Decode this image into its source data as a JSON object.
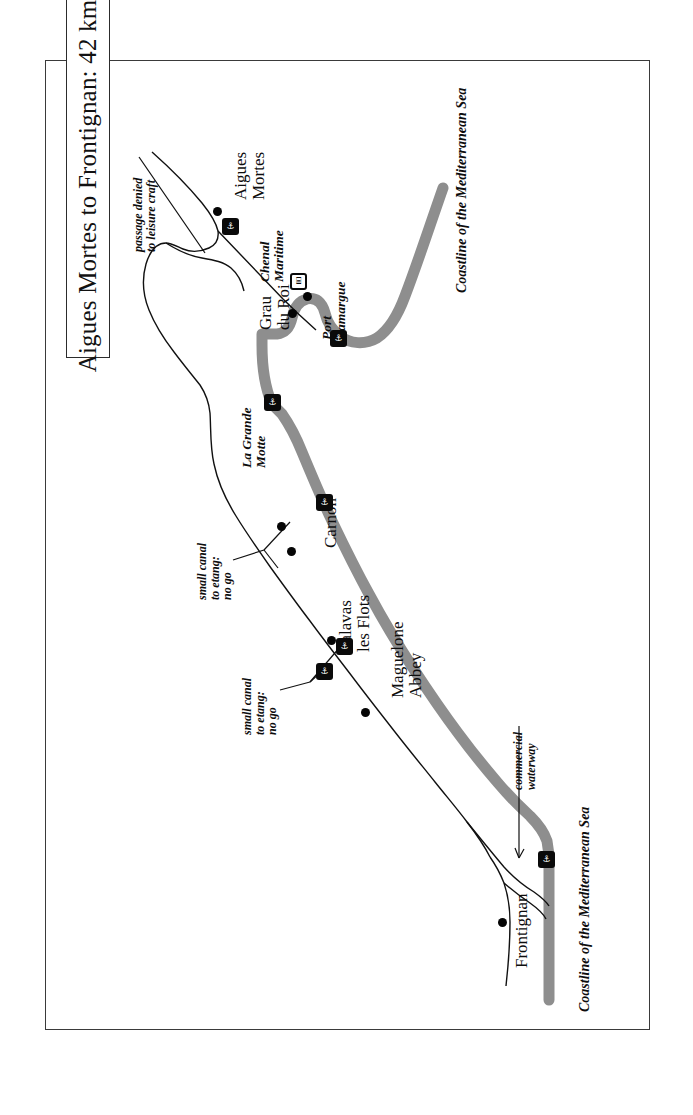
{
  "figure": {
    "title": "Aigues Mortes to Frontignan: 42 km ... no lock",
    "type": "nautical-route-map",
    "orientation": "rotated-90-ccw",
    "frame_color": "#3a3a3a",
    "coast_band_color": "#8c8c8c",
    "ink_color": "#0d0d0d"
  },
  "places": [
    {
      "id": "aigues-mortes",
      "name": "Aigues Mortes",
      "style": "roman"
    },
    {
      "id": "grau-du-roi",
      "name": "Grau\ndu Roi",
      "style": "roman"
    },
    {
      "id": "carnon",
      "name": "Carnon",
      "style": "roman"
    },
    {
      "id": "palavas",
      "name": "Palavas\nles Flots",
      "style": "roman"
    },
    {
      "id": "maguelone",
      "name": "Maguelone\nAbbey",
      "style": "roman"
    },
    {
      "id": "frontignan",
      "name": "Frontignan",
      "style": "roman"
    }
  ],
  "place_labels": {
    "aigues_mortes_l1": "Aigues",
    "aigues_mortes_l2": "Mortes",
    "grau_du_roi_l1": "Grau",
    "grau_du_roi_l2": "du Roi",
    "carnon": "Carnon",
    "palavas_l1": "Palavas",
    "palavas_l2": "les Flots",
    "maguelone_l1": "Maguelone",
    "maguelone_l2": "Abbey",
    "frontignan": "Frontignan"
  },
  "feature_labels": {
    "chenal_maritime_l1": "Chenal",
    "chenal_maritime_l2": "Maritime",
    "port_camargue_l1": "Port",
    "port_camargue_l2": "Camargue",
    "la_grande_motte_l1": "La Grande",
    "la_grande_motte_l2": "Motte",
    "coastline_top": "Coastline of the Mediterranean Sea",
    "coastline_bottom": "Coastline of the Mediterranean Sea"
  },
  "annotations": [
    {
      "id": "passage-denied",
      "line1": "passage denied",
      "line2": "to leisure craft",
      "style": "italic"
    },
    {
      "id": "small-canal-north",
      "line1": "small canal",
      "line2": "to etang:",
      "line3": "no go",
      "style": "italic"
    },
    {
      "id": "small-canal-south",
      "line1": "small canal",
      "line2": "to etang:",
      "line3": "no go",
      "style": "italic"
    },
    {
      "id": "commercial-waterway",
      "line1": "commercial",
      "line2": "waterway",
      "style": "italic"
    }
  ],
  "annotation_text": {
    "passage_denied_l1": "passage denied",
    "passage_denied_l2": "to leisure craft",
    "canal_north_l1": "small canal",
    "canal_north_l2": "to etang:",
    "canal_north_l3": "no go",
    "canal_south_l1": "small canal",
    "canal_south_l2": "to etang:",
    "canal_south_l3": "no go",
    "commercial_l1": "commercial",
    "commercial_l2": "waterway"
  },
  "markers": [
    {
      "id": "marker-aigues-mortes",
      "icon": "marina-icon",
      "variant": "dark"
    },
    {
      "id": "marker-grau-du-roi",
      "icon": "lock-icon",
      "variant": "light"
    },
    {
      "id": "marker-port-camargue",
      "icon": "marina-icon",
      "variant": "dark"
    },
    {
      "id": "marker-la-grande-motte",
      "icon": "marina-icon",
      "variant": "dark"
    },
    {
      "id": "marker-carnon",
      "icon": "marina-icon",
      "variant": "dark"
    },
    {
      "id": "marker-palavas",
      "icon": "marina-icon",
      "variant": "dark"
    },
    {
      "id": "marker-canal-south",
      "icon": "marina-icon",
      "variant": "dark"
    },
    {
      "id": "marker-frontignan",
      "icon": "marina-icon",
      "variant": "dark"
    }
  ],
  "glyphs": {
    "marina": "⚓",
    "lock": "⌸"
  }
}
